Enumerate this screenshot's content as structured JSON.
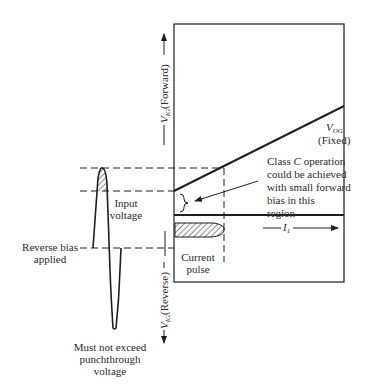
{
  "diagram": {
    "type": "transistor-bias-waveform",
    "axes": {
      "forward_label": "V",
      "forward_sub": "IG",
      "forward_rest": "(Forward)",
      "reverse_label": "V",
      "reverse_sub": "IG",
      "reverse_rest": "(Reverse)",
      "current_label": "I",
      "current_sub": "1"
    },
    "annotations": {
      "vog_label": "V",
      "vog_sub": "OG",
      "vog_fixed": "(Fixed)",
      "class_c_line1": "Class ",
      "class_c_italic": "C",
      "class_c_line1_rest": " operation",
      "class_c_line2": "could be achieved",
      "class_c_line3": "with small forward",
      "class_c_line4": "bias in this",
      "class_c_line5": "region",
      "input_voltage_line1": "Input",
      "input_voltage_line2": "voltage",
      "reverse_bias_line1": "Reverse bias",
      "reverse_bias_line2": "applied",
      "current_pulse_line1": "Current",
      "current_pulse_line2": "pulse",
      "punchthrough_line1": "Must not exceed",
      "punchthrough_line2": "punchthrough",
      "punchthrough_line3": "voltage"
    },
    "colors": {
      "ink": "#1e1e1e",
      "background": "#ffffff"
    }
  }
}
